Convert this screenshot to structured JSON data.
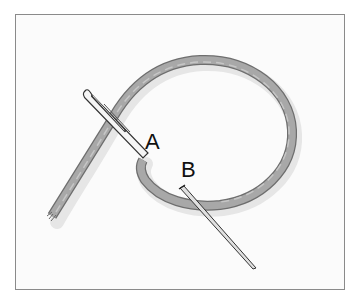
{
  "diagram": {
    "type": "stitch-illustration",
    "labels": {
      "a": "A",
      "b": "B"
    },
    "colors": {
      "thread": "#a3a3a3",
      "thread_edge": "#6e6e6e",
      "needle": "#d9d9d9",
      "needle_edge": "#333333",
      "frame_border": "#8a8a8a",
      "background": "#fbfbfb"
    }
  }
}
